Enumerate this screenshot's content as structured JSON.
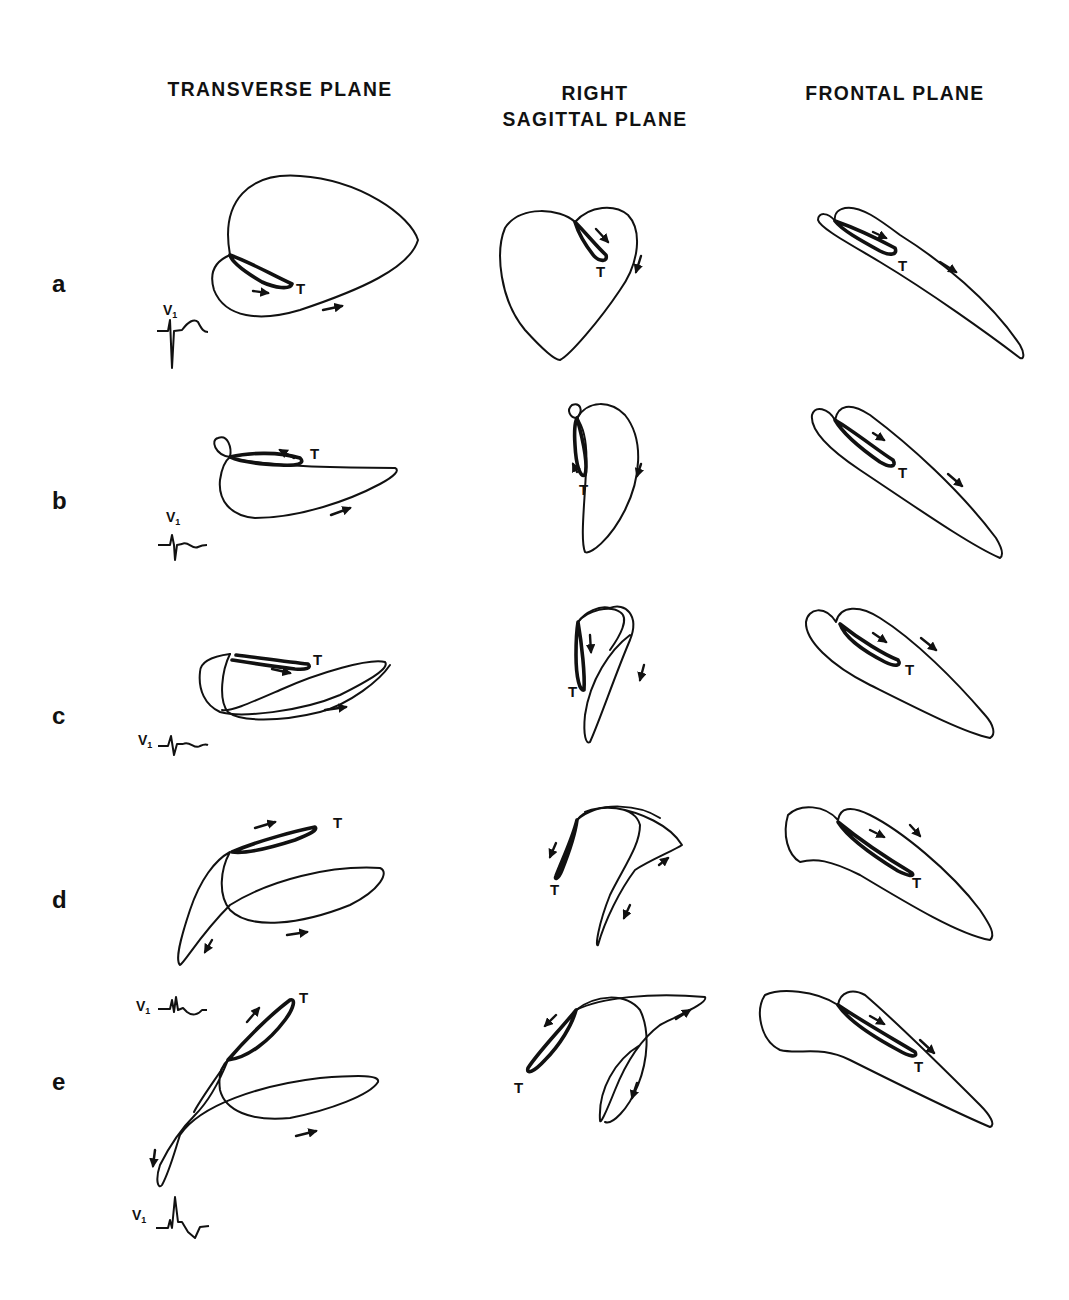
{
  "columns": [
    {
      "title": "TRANSVERSE PLANE"
    },
    {
      "title_line1": "RIGHT",
      "title_line2": "SAGITTAL PLANE"
    },
    {
      "title": "FRONTAL PLANE"
    }
  ],
  "rows": [
    {
      "label": "a",
      "t_label": "T",
      "ecg_lead": "V",
      "ecg_sub": "1"
    },
    {
      "label": "b",
      "t_label": "T",
      "ecg_lead": "V",
      "ecg_sub": "1"
    },
    {
      "label": "c",
      "t_label": "T",
      "ecg_lead": "V",
      "ecg_sub": "1"
    },
    {
      "label": "d",
      "t_label": "T"
    },
    {
      "label": "e",
      "t_label": "T",
      "ecg_lead": "V",
      "ecg_sub": "1",
      "ecg_lead_2": "V",
      "ecg_sub_2": "1"
    }
  ],
  "annotations": {
    "t_wave_marker": "T",
    "ecg_lead_name": "V1"
  }
}
